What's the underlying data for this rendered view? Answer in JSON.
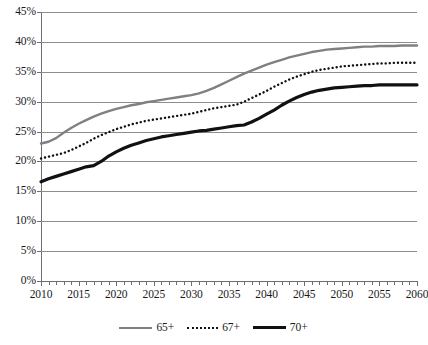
{
  "chart_data": {
    "type": "line",
    "title": "",
    "xlabel": "",
    "ylabel": "",
    "xlim": [
      2010,
      2060
    ],
    "ylim": [
      0,
      45
    ],
    "grid": true,
    "legend_position": "bottom",
    "y_tick_labels": [
      "45%",
      "40%",
      "35%",
      "30%",
      "25%",
      "20%",
      "15%",
      "10%",
      "5%",
      "0%"
    ],
    "y_tick_values": [
      45,
      40,
      35,
      30,
      25,
      20,
      15,
      10,
      5,
      0
    ],
    "x_tick_labels": [
      "2010",
      "2015",
      "2020",
      "2025",
      "2030",
      "2035",
      "2040",
      "2045",
      "2050",
      "2055",
      "2060"
    ],
    "x_tick_values": [
      2010,
      2015,
      2020,
      2025,
      2030,
      2035,
      2040,
      2045,
      2050,
      2055,
      2060
    ],
    "x_minor_tick_step": 1,
    "x": [
      2010,
      2011,
      2012,
      2013,
      2014,
      2015,
      2016,
      2017,
      2018,
      2019,
      2020,
      2021,
      2022,
      2023,
      2024,
      2025,
      2026,
      2027,
      2028,
      2029,
      2030,
      2031,
      2032,
      2033,
      2034,
      2035,
      2036,
      2037,
      2038,
      2039,
      2040,
      2041,
      2042,
      2043,
      2044,
      2045,
      2046,
      2047,
      2048,
      2049,
      2050,
      2051,
      2052,
      2053,
      2054,
      2055,
      2056,
      2057,
      2058,
      2059,
      2060
    ],
    "series": [
      {
        "name": "65+",
        "color": "#808080",
        "style": "solid",
        "width": 2.4,
        "values": [
          23.0,
          23.3,
          23.9,
          24.8,
          25.6,
          26.3,
          26.9,
          27.5,
          28.0,
          28.4,
          28.8,
          29.1,
          29.4,
          29.6,
          29.9,
          30.1,
          30.3,
          30.5,
          30.7,
          30.9,
          31.1,
          31.4,
          31.8,
          32.3,
          32.9,
          33.5,
          34.1,
          34.7,
          35.2,
          35.7,
          36.2,
          36.6,
          37.0,
          37.4,
          37.7,
          38.0,
          38.3,
          38.5,
          38.7,
          38.8,
          38.9,
          39.0,
          39.1,
          39.2,
          39.2,
          39.3,
          39.3,
          39.3,
          39.4,
          39.4,
          39.4
        ]
      },
      {
        "name": "67+",
        "color": "#111111",
        "style": "dotted",
        "width": 2.4,
        "values": [
          20.5,
          20.8,
          21.1,
          21.4,
          21.9,
          22.5,
          23.1,
          23.8,
          24.4,
          24.9,
          25.4,
          25.8,
          26.2,
          26.5,
          26.8,
          27.0,
          27.2,
          27.4,
          27.6,
          27.8,
          28.0,
          28.3,
          28.6,
          28.9,
          29.1,
          29.3,
          29.5,
          30.0,
          30.6,
          31.2,
          31.8,
          32.5,
          33.1,
          33.7,
          34.2,
          34.6,
          35.0,
          35.3,
          35.5,
          35.7,
          35.9,
          36.0,
          36.1,
          36.2,
          36.3,
          36.4,
          36.4,
          36.5,
          36.5,
          36.5,
          36.5
        ]
      },
      {
        "name": "70+",
        "color": "#111111",
        "style": "solid",
        "width": 3.2,
        "values": [
          16.6,
          17.1,
          17.5,
          17.9,
          18.3,
          18.7,
          19.1,
          19.3,
          20.0,
          20.9,
          21.6,
          22.2,
          22.7,
          23.1,
          23.5,
          23.8,
          24.1,
          24.3,
          24.5,
          24.7,
          24.9,
          25.1,
          25.2,
          25.4,
          25.6,
          25.8,
          26.0,
          26.1,
          26.6,
          27.2,
          27.9,
          28.6,
          29.4,
          30.1,
          30.7,
          31.2,
          31.6,
          31.9,
          32.1,
          32.3,
          32.4,
          32.5,
          32.6,
          32.7,
          32.7,
          32.8,
          32.8,
          32.8,
          32.8,
          32.8,
          32.8
        ]
      }
    ]
  },
  "legend": {
    "items": [
      {
        "label": "65+"
      },
      {
        "label": "67+"
      },
      {
        "label": "70+"
      }
    ]
  }
}
